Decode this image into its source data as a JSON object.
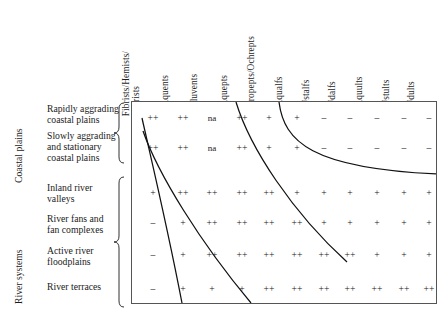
{
  "figure": {
    "type": "matrix-table"
  },
  "columns": [
    {
      "id": "histosols",
      "label": "Fibrists/Hemists/\nSaprists"
    },
    {
      "id": "aquents",
      "label": "Aquents"
    },
    {
      "id": "fluvents",
      "label": "Fluvents"
    },
    {
      "id": "aquepts",
      "label": "Aquepts"
    },
    {
      "id": "tropepts",
      "label": "Tropepts/Ochrepts"
    },
    {
      "id": "aqualfs",
      "label": "Aqualfs"
    },
    {
      "id": "ustalfs",
      "label": "Ustalfs"
    },
    {
      "id": "udalfs",
      "label": "Udalfs"
    },
    {
      "id": "aquults",
      "label": "Aquults"
    },
    {
      "id": "ustults",
      "label": "Ustults"
    },
    {
      "id": "udults",
      "label": "Udults"
    }
  ],
  "groups": [
    {
      "id": "coastal-plains",
      "label": "Coastal plains",
      "rows": [
        0,
        1
      ]
    },
    {
      "id": "river-systems",
      "label": "River systems",
      "rows": [
        2,
        3,
        4,
        5
      ]
    }
  ],
  "rows": [
    {
      "id": "rapidly-aggrading-coastal-plains",
      "label": "Rapidly aggrading\ncoastal plains",
      "values": [
        "++",
        "++",
        "na",
        "++",
        "+",
        "+",
        "–",
        "–",
        "–",
        "–",
        "–"
      ]
    },
    {
      "id": "slowly-aggrading-and-stationary-coastal-plains",
      "label": "Slowly aggrading\nand stationary\ncoastal plains",
      "values": [
        "++",
        "++",
        "na",
        "++",
        "+",
        "+",
        "–",
        "–",
        "–",
        "–",
        "–"
      ]
    },
    {
      "id": "inland-river-valleys",
      "label": "Inland river\nvalleys",
      "values": [
        "+",
        "++",
        "++",
        "++",
        "++",
        "+",
        "+",
        "+",
        "+",
        "+",
        "+"
      ]
    },
    {
      "id": "river-fans-and-fan-complexes",
      "label": "River fans and\nfan complexes",
      "values": [
        "–",
        "+",
        "++",
        "++",
        "++",
        "++",
        "+",
        "+",
        "+",
        "+",
        "+"
      ]
    },
    {
      "id": "active-river-floodplains",
      "label": "Active river\nfloodplains",
      "values": [
        "–",
        "+",
        "++",
        "++",
        "++",
        "++",
        "++",
        "++",
        "+",
        "+",
        "+"
      ]
    },
    {
      "id": "river-terraces",
      "label": "River terraces",
      "values": [
        "–",
        "+",
        "+",
        "+",
        "++",
        "++",
        "++",
        "++",
        "++",
        "++",
        "++"
      ]
    }
  ],
  "colors": {
    "ink": "#1a1a1a",
    "frame": "#555555",
    "curve": "#111111",
    "background": "#ffffff"
  }
}
